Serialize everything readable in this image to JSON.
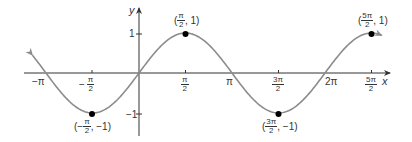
{
  "chart_data": {
    "type": "line",
    "title": "",
    "function": "y = sin x",
    "xlabel": "x",
    "ylabel": "y",
    "xlim": [
      -3.5,
      8.2
    ],
    "ylim": [
      -1.35,
      1.35
    ],
    "grid": false,
    "x_ticks": [
      {
        "value": -3.14159,
        "label_num": "−π",
        "label_den": ""
      },
      {
        "value": -1.5708,
        "label_num": "− π",
        "label_den": "2"
      },
      {
        "value": 1.5708,
        "label_num": "π",
        "label_den": "2"
      },
      {
        "value": 3.14159,
        "label_num": "π",
        "label_den": ""
      },
      {
        "value": 4.7124,
        "label_num": "3π",
        "label_den": "2"
      },
      {
        "value": 6.28319,
        "label_num": "2π",
        "label_den": ""
      },
      {
        "value": 7.854,
        "label_num": "5π",
        "label_den": "2"
      }
    ],
    "y_ticks": [
      {
        "value": 1,
        "label": "1"
      },
      {
        "value": -1,
        "label": "−1"
      }
    ],
    "series": [
      {
        "name": "sin x",
        "color": "#8c8c8c",
        "x_range": [
          -3.6,
          8.2
        ]
      }
    ],
    "marked_points": [
      {
        "x": -1.5708,
        "y": -1,
        "label_num": "π",
        "label_den": "2",
        "label_prefix": "(−",
        "label_suffix": ", −1)"
      },
      {
        "x": 1.5708,
        "y": 1,
        "label_num": "π",
        "label_den": "2",
        "label_prefix": "(",
        "label_suffix": ", 1)"
      },
      {
        "x": 4.7124,
        "y": -1,
        "label_num": "3π",
        "label_den": "2",
        "label_prefix": "(",
        "label_suffix": ", −1)"
      },
      {
        "x": 7.854,
        "y": 1,
        "label_num": "5π",
        "label_den": "2",
        "label_prefix": "(",
        "label_suffix": ", 1)"
      }
    ]
  },
  "axes": {
    "x_label": "x",
    "y_label": "y",
    "y_tick_1": "1",
    "y_tick_neg1": "−1",
    "x_tick_neg_pi": "−π",
    "x_tick_neg_half_pi_sign": "−",
    "x_tick_neg_half_pi_num": "π",
    "x_tick_neg_half_pi_den": "2",
    "x_tick_half_pi_num": "π",
    "x_tick_half_pi_den": "2",
    "x_tick_pi": "π",
    "x_tick_3half_pi_num": "3π",
    "x_tick_3half_pi_den": "2",
    "x_tick_2pi": "2π",
    "x_tick_5half_pi_num": "5π",
    "x_tick_5half_pi_den": "2"
  },
  "points": {
    "p1": {
      "prefix": "(−",
      "num": "π",
      "den": "2",
      "suffix": ", −1)"
    },
    "p2": {
      "prefix": "(",
      "num": "π",
      "den": "2",
      "suffix": ", 1)"
    },
    "p3": {
      "prefix": "(",
      "num": "3π",
      "den": "2",
      "suffix": ", −1)"
    },
    "p4": {
      "prefix": "(",
      "num": "5π",
      "den": "2",
      "suffix": ", 1)"
    }
  },
  "colors": {
    "curve": "#8c8c8c",
    "axis": "#333333",
    "point": "#000000"
  }
}
